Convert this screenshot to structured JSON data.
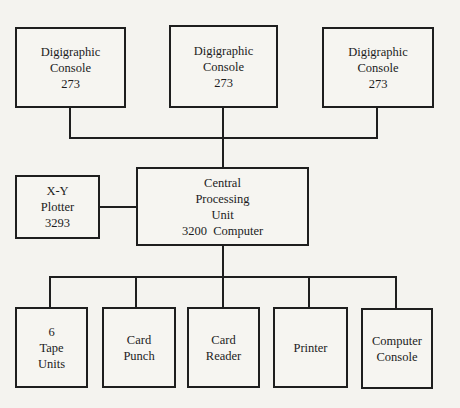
{
  "diagram": {
    "type": "block-diagram",
    "nodes": {
      "console1": {
        "lines": [
          "Digigraphic",
          "Console",
          "273"
        ]
      },
      "console2": {
        "lines": [
          "Digigraphic",
          "Console",
          "273"
        ]
      },
      "console3": {
        "lines": [
          "Digigraphic",
          "Console",
          "273"
        ]
      },
      "plotter": {
        "lines": [
          "X-Y",
          "Plotter",
          "3293"
        ]
      },
      "cpu": {
        "lines": [
          "Central",
          "Processing",
          "Unit",
          "3200  Computer"
        ]
      },
      "tape": {
        "lines": [
          "6",
          "Tape",
          "Units"
        ]
      },
      "punch": {
        "lines": [
          "Card",
          "Punch"
        ]
      },
      "reader": {
        "lines": [
          "Card",
          "Reader"
        ]
      },
      "printer": {
        "lines": [
          "Printer"
        ]
      },
      "compconsole": {
        "lines": [
          "Computer",
          "Console"
        ]
      }
    },
    "edges": [
      [
        "console1",
        "cpu"
      ],
      [
        "console2",
        "cpu"
      ],
      [
        "console3",
        "cpu"
      ],
      [
        "plotter",
        "cpu"
      ],
      [
        "cpu",
        "tape"
      ],
      [
        "cpu",
        "punch"
      ],
      [
        "cpu",
        "reader"
      ],
      [
        "cpu",
        "printer"
      ],
      [
        "cpu",
        "compconsole"
      ]
    ],
    "colors": {
      "stroke": "#1e1e1e",
      "paper": "#f4f3ef"
    }
  }
}
